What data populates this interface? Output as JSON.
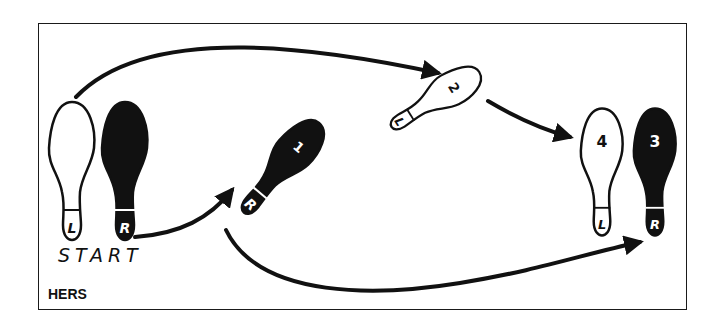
{
  "diagram": {
    "title_label": "HERS",
    "start_label": "START",
    "colors": {
      "ink": "#111111",
      "paper": "#ffffff"
    },
    "footprints": [
      {
        "id": "start-left",
        "foot": "L",
        "step": "",
        "fill": "outline"
      },
      {
        "id": "start-right",
        "foot": "R",
        "step": "",
        "fill": "solid"
      },
      {
        "id": "step-1",
        "foot": "R",
        "step": "1",
        "fill": "solid"
      },
      {
        "id": "step-2",
        "foot": "L",
        "step": "2",
        "fill": "outline"
      },
      {
        "id": "step-3",
        "foot": "R",
        "step": "3",
        "fill": "solid"
      },
      {
        "id": "step-4",
        "foot": "L",
        "step": "4",
        "fill": "outline"
      }
    ],
    "arrows": [
      {
        "from": "start-left",
        "to": "step-2"
      },
      {
        "from": "start-right",
        "to": "step-1"
      },
      {
        "from": "step-1",
        "to": "step-3"
      },
      {
        "from": "step-2",
        "to": "step-4"
      }
    ]
  }
}
